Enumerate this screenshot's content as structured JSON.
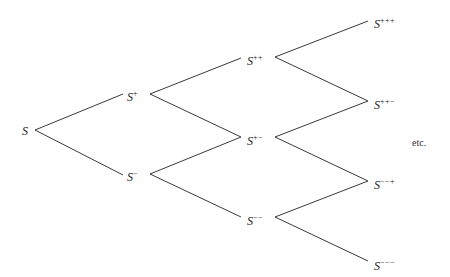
{
  "diagram": {
    "type": "binomial-tree",
    "nodes": [
      {
        "id": "S",
        "base": "S",
        "sup": "",
        "x": 22,
        "y": 125
      },
      {
        "id": "Sp",
        "base": "S",
        "sup": "+",
        "x": 127,
        "y": 88
      },
      {
        "id": "Sm",
        "base": "S",
        "sup": "−",
        "x": 127,
        "y": 168
      },
      {
        "id": "Spp",
        "base": "S",
        "sup": "++",
        "x": 247,
        "y": 52
      },
      {
        "id": "Spm",
        "base": "S",
        "sup": "+−",
        "x": 247,
        "y": 132
      },
      {
        "id": "Smm",
        "base": "S",
        "sup": "−−",
        "x": 247,
        "y": 212
      },
      {
        "id": "Sppp",
        "base": "S",
        "sup": "+++",
        "x": 374,
        "y": 15
      },
      {
        "id": "Sppm",
        "base": "S",
        "sup": "++−",
        "x": 374,
        "y": 96
      },
      {
        "id": "Smmp",
        "base": "S",
        "sup": "−−+",
        "x": 374,
        "y": 176
      },
      {
        "id": "Smmm",
        "base": "S",
        "sup": "−−−",
        "x": 374,
        "y": 257
      }
    ],
    "edges": [
      {
        "from": "S",
        "to": "Sp",
        "x1": 35,
        "y1": 130,
        "x2": 123,
        "y2": 94
      },
      {
        "from": "S",
        "to": "Sm",
        "x1": 35,
        "y1": 130,
        "x2": 123,
        "y2": 175
      },
      {
        "from": "Sp",
        "to": "Spp",
        "x1": 150,
        "y1": 94,
        "x2": 241,
        "y2": 58
      },
      {
        "from": "Sp",
        "to": "Spm",
        "x1": 150,
        "y1": 94,
        "x2": 241,
        "y2": 137
      },
      {
        "from": "Sm",
        "to": "Spm",
        "x1": 150,
        "y1": 174,
        "x2": 241,
        "y2": 137
      },
      {
        "from": "Sm",
        "to": "Smm",
        "x1": 150,
        "y1": 174,
        "x2": 241,
        "y2": 217
      },
      {
        "from": "Spp",
        "to": "Sppp",
        "x1": 275,
        "y1": 57,
        "x2": 368,
        "y2": 21
      },
      {
        "from": "Spp",
        "to": "Sppm",
        "x1": 275,
        "y1": 57,
        "x2": 368,
        "y2": 101
      },
      {
        "from": "Spm",
        "to": "Sppm",
        "x1": 275,
        "y1": 137,
        "x2": 368,
        "y2": 101
      },
      {
        "from": "Spm",
        "to": "Smmp",
        "x1": 275,
        "y1": 137,
        "x2": 368,
        "y2": 181
      },
      {
        "from": "Smm",
        "to": "Smmp",
        "x1": 275,
        "y1": 217,
        "x2": 368,
        "y2": 181
      },
      {
        "from": "Smm",
        "to": "Smmm",
        "x1": 275,
        "y1": 217,
        "x2": 368,
        "y2": 261
      }
    ],
    "etc_label": "etc.",
    "etc_pos": {
      "x": 412,
      "y": 138
    },
    "line_color": "#3a3a3a"
  }
}
